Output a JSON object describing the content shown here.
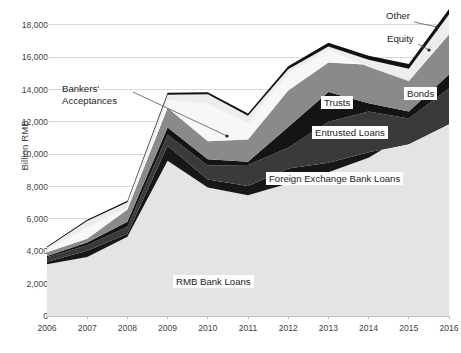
{
  "chart_data": {
    "type": "area",
    "stacked": true,
    "title": "",
    "xlabel": "",
    "ylabel": "Billion RMB",
    "x": [
      2006,
      2007,
      2008,
      2009,
      2010,
      2011,
      2012,
      2013,
      2014,
      2015,
      2016
    ],
    "xtick_labels": [
      "2006",
      "2007",
      "2008",
      "2009",
      "2010",
      "2011",
      "2012",
      "2013",
      "2014",
      "2015",
      "2016"
    ],
    "ytick_labels": [
      "0",
      "2,000",
      "4,000",
      "6,000",
      "8,000",
      "10,000",
      "12,000",
      "14,000",
      "16,000",
      "18,000"
    ],
    "ytick_values": [
      0,
      2000,
      4000,
      6000,
      8000,
      10000,
      12000,
      14000,
      16000,
      18000
    ],
    "ylim": [
      0,
      18800
    ],
    "xlim": [
      2006,
      2016
    ],
    "grid": "horizontal",
    "legend": "inline-labels",
    "series": [
      {
        "name": "RMB Bank Loans",
        "color": "#e4e4e4",
        "values": [
          3200,
          3650,
          4900,
          9600,
          7950,
          7470,
          8200,
          8890,
          9780,
          11270,
          12440
        ]
      },
      {
        "name": "Foreign Exchange Bank Loans",
        "color": "#171717",
        "values": [
          160,
          390,
          190,
          930,
          490,
          570,
          920,
          580,
          350,
          -640,
          -560
        ]
      },
      {
        "name": "Entrusted Loans",
        "color": "#3a3a3a",
        "values": [
          270,
          340,
          430,
          680,
          870,
          1300,
          1280,
          2550,
          2510,
          1590,
          2190
        ]
      },
      {
        "name": "Trusts",
        "color": "#141414",
        "values": [
          80,
          170,
          310,
          440,
          390,
          200,
          1290,
          1840,
          520,
          430,
          860
        ]
      },
      {
        "name": "Bonds",
        "color": "#8a8a8a",
        "values": [
          230,
          230,
          750,
          1230,
          1100,
          1370,
          2250,
          1810,
          2380,
          2940,
          2670
        ]
      },
      {
        "name": "Bankers' Acceptances",
        "color": "#f7f7f7",
        "values": [
          150,
          670,
          110,
          460,
          2330,
          1030,
          1070,
          780,
          -130,
          -1060,
          -190
        ]
      },
      {
        "name": "Equity",
        "color": "#ededed",
        "values": [
          150,
          430,
          340,
          340,
          580,
          440,
          250,
          220,
          430,
          760,
          1240
        ]
      },
      {
        "name": "Other",
        "color": "#111111",
        "values": [
          60,
          80,
          90,
          120,
          130,
          140,
          190,
          230,
          260,
          290,
          330
        ]
      }
    ],
    "annotations": [
      {
        "text": "Bankers'\nAcceptances",
        "kind": "leader",
        "series": "Bankers' Acceptances"
      },
      {
        "text": "Trusts",
        "kind": "box",
        "series": "Trusts"
      },
      {
        "text": "Entrusted Loans",
        "kind": "box",
        "series": "Entrusted Loans"
      },
      {
        "text": "Foreign Exchange Bank Loans",
        "kind": "box",
        "series": "Foreign Exchange Bank Loans"
      },
      {
        "text": "RMB Bank Loans",
        "kind": "box",
        "series": "RMB Bank Loans"
      },
      {
        "text": "Bonds",
        "kind": "box",
        "series": "Bonds"
      },
      {
        "text": "Equity",
        "kind": "leader",
        "series": "Equity"
      },
      {
        "text": "Other",
        "kind": "leader",
        "series": "Other"
      }
    ]
  },
  "labels": {
    "bankers_acceptances_l1": "Bankers'",
    "bankers_acceptances_l2": "Acceptances",
    "trusts": "Trusts",
    "entrusted_loans": "Entrusted Loans",
    "foreign_exchange_bank_loans": "Foreign Exchange Bank Loans",
    "rmb_bank_loans": "RMB Bank Loans",
    "bonds": "Bonds",
    "equity": "Equity",
    "other": "Other"
  },
  "style": {
    "plot_background": "#ffffff",
    "gridline_color": "#d9d9d9",
    "axis_color": "#bfbfbf",
    "text_color": "#3f3f3f"
  }
}
